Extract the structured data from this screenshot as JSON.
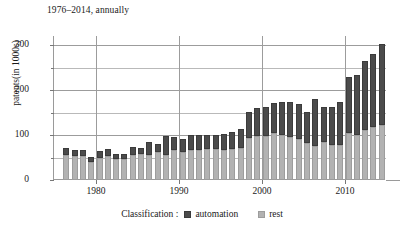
{
  "chart_data": {
    "type": "bar",
    "subtype": "stacked-vertical",
    "title": "1976–2014, annually",
    "xlabel": "",
    "ylabel": "patents(in 1000s)",
    "ylim": [
      0,
      320
    ],
    "xlim": [
      1975,
      2015
    ],
    "grid": true,
    "y_major_ticks": [
      0,
      100,
      200,
      300
    ],
    "y_minor_ticks": [
      50,
      150,
      250
    ],
    "x_ticks": [
      1980,
      1990,
      2000,
      2010
    ],
    "x_gridlines": [
      1980,
      1990,
      2000,
      2010
    ],
    "legend_position": "bottom-center",
    "legend_title": "Classification :",
    "categories": [
      1976,
      1977,
      1978,
      1979,
      1980,
      1981,
      1982,
      1983,
      1984,
      1985,
      1986,
      1987,
      1988,
      1989,
      1990,
      1991,
      1992,
      1993,
      1994,
      1995,
      1996,
      1997,
      1998,
      1999,
      2000,
      2001,
      2002,
      2003,
      2004,
      2005,
      2006,
      2007,
      2008,
      2009,
      2010,
      2011,
      2012,
      2013,
      2014
    ],
    "series": [
      {
        "name": "rest",
        "color": "#b2b2b2",
        "values": [
          55,
          53,
          53,
          41,
          50,
          53,
          46,
          46,
          55,
          57,
          56,
          62,
          55,
          66,
          63,
          66,
          67,
          68,
          68,
          67,
          68,
          72,
          94,
          98,
          98,
          104,
          100,
          95,
          92,
          83,
          76,
          84,
          78,
          78,
          104,
          100,
          112,
          117,
          123
        ]
      },
      {
        "name": "automation",
        "color": "#4b4b4b",
        "values": [
          17,
          13,
          14,
          10,
          14,
          16,
          11,
          12,
          18,
          15,
          28,
          17,
          42,
          30,
          29,
          35,
          34,
          33,
          33,
          36,
          38,
          41,
          58,
          62,
          65,
          67,
          73,
          79,
          77,
          68,
          104,
          78,
          85,
          96,
          125,
          134,
          152,
          164,
          179
        ]
      }
    ],
    "totals": [
      72,
      66,
      67,
      51,
      64,
      69,
      57,
      58,
      73,
      72,
      84,
      79,
      97,
      96,
      92,
      101,
      101,
      101,
      101,
      103,
      106,
      113,
      152,
      160,
      163,
      171,
      173,
      174,
      169,
      151,
      180,
      162,
      163,
      174,
      229,
      234,
      264,
      281,
      302
    ]
  },
  "legend": {
    "title": "Classification :",
    "entries": [
      {
        "label": "automation",
        "color": "#4b4b4b"
      },
      {
        "label": "rest",
        "color": "#b2b2b2"
      }
    ]
  },
  "axes": {
    "y_tick_labels": [
      "0",
      "100",
      "200",
      "300"
    ],
    "x_tick_labels": [
      "1980",
      "1990",
      "2000",
      "2010"
    ]
  }
}
